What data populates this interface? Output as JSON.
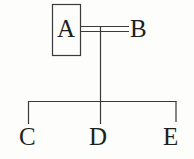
{
  "diagram": {
    "title": "",
    "background_color": "#fdfdfb",
    "stroke_color": "#3a3a38",
    "text_color": "#201f1d",
    "nodes": [
      {
        "id": "A",
        "label": "A",
        "shape": "rectangle",
        "boxed": true,
        "x": 52,
        "y": 4,
        "width": 29,
        "height": 52
      },
      {
        "id": "B",
        "label": "B",
        "shape": "plain",
        "boxed": false,
        "x": 130,
        "y": 16,
        "width": 17,
        "height": 24
      },
      {
        "id": "C",
        "label": "C",
        "shape": "plain",
        "boxed": false,
        "x": 19,
        "y": 124,
        "width": 18,
        "height": 24
      },
      {
        "id": "D",
        "label": "D",
        "shape": "plain",
        "boxed": false,
        "x": 89,
        "y": 124,
        "width": 19,
        "height": 24
      },
      {
        "id": "E",
        "label": "E",
        "shape": "plain",
        "boxed": false,
        "x": 163,
        "y": 124,
        "width": 17,
        "height": 24
      }
    ],
    "edges": [
      {
        "from": "A",
        "to": "B",
        "style": "double-line",
        "orientation": "horizontal"
      },
      {
        "from": "A-B",
        "to": "branch-bar",
        "style": "single-line",
        "orientation": "vertical"
      },
      {
        "from": "branch-bar",
        "to": "C",
        "style": "single-line",
        "orientation": "elbow-left"
      },
      {
        "from": "branch-bar",
        "to": "D",
        "style": "single-line",
        "orientation": "vertical"
      },
      {
        "from": "branch-bar",
        "to": "E",
        "style": "single-line",
        "orientation": "elbow-right"
      }
    ],
    "geometry": {
      "box_a": {
        "x": 52,
        "y": 4,
        "width": 29,
        "height": 52
      },
      "double_line": {
        "x1": 81,
        "x2": 129,
        "y_top": 26,
        "y_bottom": 31
      },
      "stem": {
        "x": 100,
        "y1": 28,
        "y2": 101
      },
      "bus": {
        "x1": 28,
        "x2": 176,
        "y": 101
      },
      "drop_c": {
        "x": 28,
        "y1": 101,
        "y2": 124
      },
      "drop_d": {
        "x": 100,
        "y1": 101,
        "y2": 124
      },
      "drop_e": {
        "x": 176,
        "y1": 101,
        "y2": 122
      }
    }
  }
}
